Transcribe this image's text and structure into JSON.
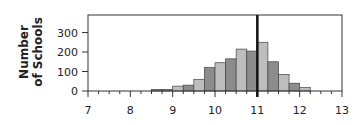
{
  "chart_data": {
    "type": "bar",
    "title": "",
    "xlabel": "",
    "ylabel": "Number of Schools",
    "ylabel_lines": [
      "Number",
      "of Schools"
    ],
    "xlim": [
      7,
      13
    ],
    "ylim": [
      0,
      390
    ],
    "x_ticks": [
      7,
      8,
      9,
      10,
      11,
      12,
      13
    ],
    "y_ticks": [
      0,
      100,
      200,
      300
    ],
    "bin_width": 0.25,
    "bins": [
      {
        "x0": 8.5,
        "x1": 8.75,
        "value": 8,
        "shade": "dark"
      },
      {
        "x0": 8.75,
        "x1": 9.0,
        "value": 8,
        "shade": "dark"
      },
      {
        "x0": 9.0,
        "x1": 9.25,
        "value": 25,
        "shade": "light"
      },
      {
        "x0": 9.25,
        "x1": 9.5,
        "value": 30,
        "shade": "dark"
      },
      {
        "x0": 9.5,
        "x1": 9.75,
        "value": 60,
        "shade": "light"
      },
      {
        "x0": 9.75,
        "x1": 10.0,
        "value": 120,
        "shade": "dark"
      },
      {
        "x0": 10.0,
        "x1": 10.25,
        "value": 145,
        "shade": "light"
      },
      {
        "x0": 10.25,
        "x1": 10.5,
        "value": 165,
        "shade": "dark"
      },
      {
        "x0": 10.5,
        "x1": 10.75,
        "value": 215,
        "shade": "light"
      },
      {
        "x0": 10.75,
        "x1": 11.0,
        "value": 205,
        "shade": "dark"
      },
      {
        "x0": 11.0,
        "x1": 11.25,
        "value": 250,
        "shade": "light"
      },
      {
        "x0": 11.25,
        "x1": 11.5,
        "value": 150,
        "shade": "dark"
      },
      {
        "x0": 11.5,
        "x1": 11.75,
        "value": 85,
        "shade": "light"
      },
      {
        "x0": 11.75,
        "x1": 12.0,
        "value": 40,
        "shade": "dark"
      },
      {
        "x0": 12.0,
        "x1": 12.25,
        "value": 18,
        "shade": "light"
      }
    ],
    "reference_line": {
      "x": 11,
      "color": "#111111"
    },
    "grid": false,
    "legend": null,
    "colors": {
      "dark": "#8c8c8c",
      "light": "#bdbdbd",
      "edge": "#444444",
      "axis": "#333333"
    }
  }
}
